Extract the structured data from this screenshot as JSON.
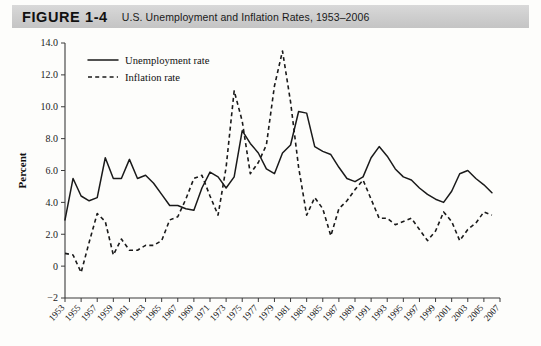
{
  "header": {
    "figure_label": "FIGURE 1-4",
    "caption": "U.S. Unemployment and Inflation Rates, 1953–2006"
  },
  "chart_data": {
    "type": "line",
    "title": "U.S. Unemployment and Inflation Rates, 1953–2006",
    "xlabel": "",
    "ylabel": "Percent",
    "xlim": [
      1953,
      2007
    ],
    "ylim": [
      -2,
      14
    ],
    "grid": false,
    "legend_position": "top-left",
    "ytick_labels": [
      "14.0",
      "12.0",
      "10.0",
      "8.0",
      "6.0",
      "4.0",
      "2.0",
      "0",
      "−2"
    ],
    "ytick_values": [
      14,
      12,
      10,
      8,
      6,
      4,
      2,
      0,
      -2
    ],
    "xtick_labels": [
      "1953",
      "1955",
      "1957",
      "1959",
      "1961",
      "1963",
      "1965",
      "1967",
      "1969",
      "1971",
      "1973",
      "1975",
      "1977",
      "1979",
      "1981",
      "1983",
      "1985",
      "1987",
      "1989",
      "1991",
      "1993",
      "1995",
      "1997",
      "1999",
      "2001",
      "2003",
      "2005",
      "2007"
    ],
    "xtick_values": [
      1953,
      1955,
      1957,
      1959,
      1961,
      1963,
      1965,
      1967,
      1969,
      1971,
      1973,
      1975,
      1977,
      1979,
      1981,
      1983,
      1985,
      1987,
      1989,
      1991,
      1993,
      1995,
      1997,
      1999,
      2001,
      2003,
      2005,
      2007
    ],
    "x": [
      1953,
      1954,
      1955,
      1956,
      1957,
      1958,
      1959,
      1960,
      1961,
      1962,
      1963,
      1964,
      1965,
      1966,
      1967,
      1968,
      1969,
      1970,
      1971,
      1972,
      1973,
      1974,
      1975,
      1976,
      1977,
      1978,
      1979,
      1980,
      1981,
      1982,
      1983,
      1984,
      1985,
      1986,
      1987,
      1988,
      1989,
      1990,
      1991,
      1992,
      1993,
      1994,
      1995,
      1996,
      1997,
      1998,
      1999,
      2000,
      2001,
      2002,
      2003,
      2004,
      2005,
      2006
    ],
    "series": [
      {
        "name": "Unemployment rate",
        "style": "solid",
        "color": "#1a1a1a",
        "values": [
          2.9,
          5.5,
          4.4,
          4.1,
          4.3,
          6.8,
          5.5,
          5.5,
          6.7,
          5.5,
          5.7,
          5.2,
          4.5,
          3.8,
          3.8,
          3.6,
          3.5,
          4.9,
          5.9,
          5.6,
          4.9,
          5.6,
          8.5,
          7.7,
          7.1,
          6.1,
          5.8,
          7.1,
          7.6,
          9.7,
          9.6,
          7.5,
          7.2,
          7.0,
          6.2,
          5.5,
          5.3,
          5.6,
          6.8,
          7.5,
          6.9,
          6.1,
          5.6,
          5.4,
          4.9,
          4.5,
          4.2,
          4.0,
          4.7,
          5.8,
          6.0,
          5.5,
          5.1,
          4.6
        ]
      },
      {
        "name": "Inflation rate",
        "style": "dashed",
        "color": "#1a1a1a",
        "values": [
          0.8,
          0.7,
          -0.4,
          1.5,
          3.3,
          2.8,
          0.7,
          1.7,
          1.0,
          1.0,
          1.3,
          1.3,
          1.6,
          2.9,
          3.1,
          4.2,
          5.5,
          5.7,
          4.4,
          3.2,
          6.2,
          11.0,
          9.1,
          5.8,
          6.5,
          7.6,
          11.3,
          13.5,
          10.3,
          6.2,
          3.2,
          4.3,
          3.6,
          1.9,
          3.6,
          4.1,
          4.8,
          5.4,
          4.2,
          3.0,
          3.0,
          2.6,
          2.8,
          3.0,
          2.3,
          1.6,
          2.2,
          3.4,
          2.8,
          1.6,
          2.3,
          2.7,
          3.4,
          3.2
        ]
      }
    ]
  },
  "legend": {
    "items": [
      {
        "label": "Unemployment rate",
        "style": "solid"
      },
      {
        "label": "Inflation rate",
        "style": "dashed"
      }
    ]
  }
}
